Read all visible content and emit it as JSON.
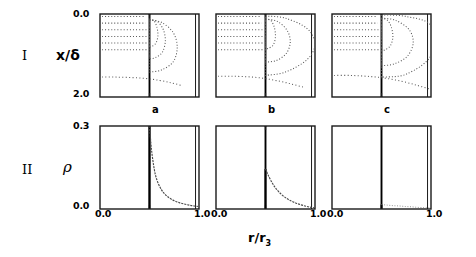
{
  "figure": {
    "rows": [
      {
        "tag": "I",
        "ylabel": "x/δ",
        "ytop": "0.0",
        "ybottom": "2.0",
        "ylim": [
          0.0,
          2.0
        ],
        "y_inverted": true,
        "plot_type": "contour"
      },
      {
        "tag": "II",
        "ylabel": "ρ",
        "ytop": "0.3",
        "ybottom": "0.0",
        "ylim": [
          0.0,
          0.3
        ],
        "y_inverted": false,
        "plot_type": "line"
      }
    ],
    "columns": [
      {
        "letter": "a",
        "xleft": "0.0",
        "xright": "1.0"
      },
      {
        "letter": "b",
        "xleft": "0.0",
        "xright": "1.0"
      },
      {
        "letter": "c",
        "xleft": "0.0",
        "xright": "1.0"
      }
    ],
    "xlabel_main": "r/r",
    "xlabel_sub": "3",
    "xlim": [
      0.0,
      1.0
    ],
    "divider_x": 0.5,
    "inner_right_x": 0.965,
    "colors": {
      "axis": "#1a1a1a",
      "divider": "#000000",
      "contour": "#555555",
      "curve": "#4a4a4a",
      "background": "#ffffff"
    }
  },
  "chart_data": [
    {
      "type": "line",
      "panel": "I-a",
      "title": "a",
      "xlabel": "r/r3",
      "ylabel": "x/δ",
      "xlim": [
        0.0,
        1.0
      ],
      "ylim": [
        0.0,
        2.0
      ],
      "y_inverted": true,
      "grid": false,
      "legend": "none",
      "description": "Dotted contour map: horizontal dotted streak contours fill the left half (r/r3 < 0.5); to the right of the bold divider at r/r3=0.5 a family of nested closed dotted loops bulges outward reaching about r/r3=0.78 near x/δ=1.0",
      "series": [
        {
          "name": "horizontal-contour-1",
          "x": [
            0.02,
            0.12,
            0.24,
            0.36,
            0.45
          ],
          "values": [
            0.06,
            0.06,
            0.06,
            0.06,
            0.06
          ]
        },
        {
          "name": "horizontal-contour-2",
          "x": [
            0.02,
            0.12,
            0.24,
            0.36,
            0.46
          ],
          "values": [
            0.22,
            0.22,
            0.22,
            0.22,
            0.22
          ]
        },
        {
          "name": "horizontal-contour-3",
          "x": [
            0.02,
            0.12,
            0.24,
            0.36,
            0.47
          ],
          "values": [
            0.38,
            0.38,
            0.38,
            0.38,
            0.38
          ]
        },
        {
          "name": "horizontal-contour-4",
          "x": [
            0.02,
            0.12,
            0.24,
            0.36,
            0.47
          ],
          "values": [
            0.54,
            0.54,
            0.54,
            0.54,
            0.54
          ]
        },
        {
          "name": "horizontal-contour-5",
          "x": [
            0.02,
            0.12,
            0.24,
            0.36,
            0.48
          ],
          "values": [
            0.7,
            0.7,
            0.7,
            0.7,
            0.7
          ]
        },
        {
          "name": "horizontal-contour-6",
          "x": [
            0.02,
            0.12,
            0.24,
            0.36,
            0.48
          ],
          "values": [
            0.86,
            0.86,
            0.86,
            0.86,
            0.86
          ]
        },
        {
          "name": "outer-loop",
          "x": [
            0.5,
            0.62,
            0.74,
            0.78,
            0.74,
            0.62,
            0.5
          ],
          "values": [
            0.15,
            0.2,
            0.45,
            0.8,
            1.15,
            1.35,
            1.4
          ]
        },
        {
          "name": "mid-loop",
          "x": [
            0.5,
            0.58,
            0.64,
            0.66,
            0.63,
            0.56,
            0.5
          ],
          "values": [
            0.14,
            0.18,
            0.38,
            0.65,
            0.92,
            1.05,
            1.08
          ]
        },
        {
          "name": "inner-loop",
          "x": [
            0.5,
            0.545,
            0.575,
            0.585,
            0.565,
            0.525,
            0.5
          ],
          "values": [
            0.12,
            0.16,
            0.32,
            0.52,
            0.7,
            0.78,
            0.8
          ]
        },
        {
          "name": "lower-sweep",
          "x": [
            0.02,
            0.15,
            0.3,
            0.45,
            0.6,
            0.72,
            0.82
          ],
          "values": [
            1.52,
            1.52,
            1.53,
            1.55,
            1.6,
            1.66,
            1.72
          ]
        }
      ]
    },
    {
      "type": "line",
      "panel": "I-b",
      "title": "b",
      "xlabel": "r/r3",
      "ylabel": "x/δ",
      "xlim": [
        0.0,
        1.0
      ],
      "ylim": [
        0.0,
        2.0
      ],
      "y_inverted": true,
      "grid": false,
      "legend": "none",
      "description": "Same dotted contour structure as panel a but the nested loops are wider, the outermost contour extending past r/r3=1.0 off the right edge of the frame",
      "series": [
        {
          "name": "horizontal-contour-1",
          "x": [
            0.02,
            0.12,
            0.24,
            0.36,
            0.45
          ],
          "values": [
            0.06,
            0.06,
            0.06,
            0.06,
            0.06
          ]
        },
        {
          "name": "horizontal-contour-2",
          "x": [
            0.02,
            0.12,
            0.24,
            0.36,
            0.46
          ],
          "values": [
            0.22,
            0.22,
            0.22,
            0.22,
            0.22
          ]
        },
        {
          "name": "horizontal-contour-3",
          "x": [
            0.02,
            0.12,
            0.24,
            0.36,
            0.47
          ],
          "values": [
            0.38,
            0.38,
            0.38,
            0.38,
            0.38
          ]
        },
        {
          "name": "horizontal-contour-4",
          "x": [
            0.02,
            0.12,
            0.24,
            0.36,
            0.47
          ],
          "values": [
            0.54,
            0.54,
            0.54,
            0.54,
            0.54
          ]
        },
        {
          "name": "horizontal-contour-5",
          "x": [
            0.02,
            0.12,
            0.24,
            0.36,
            0.48
          ],
          "values": [
            0.7,
            0.7,
            0.7,
            0.7,
            0.7
          ]
        },
        {
          "name": "horizontal-contour-6",
          "x": [
            0.02,
            0.12,
            0.24,
            0.36,
            0.48
          ],
          "values": [
            0.86,
            0.86,
            0.86,
            0.86,
            0.86
          ]
        },
        {
          "name": "outer-loop",
          "x": [
            0.5,
            0.7,
            0.92,
            1.0,
            0.92,
            0.7,
            0.5
          ],
          "values": [
            0.05,
            0.1,
            0.35,
            0.72,
            1.1,
            1.4,
            1.48
          ]
        },
        {
          "name": "mid-loop",
          "x": [
            0.5,
            0.62,
            0.72,
            0.75,
            0.71,
            0.61,
            0.5
          ],
          "values": [
            0.12,
            0.18,
            0.4,
            0.68,
            0.95,
            1.12,
            1.16
          ]
        },
        {
          "name": "inner-loop",
          "x": [
            0.5,
            0.555,
            0.59,
            0.6,
            0.58,
            0.535,
            0.5
          ],
          "values": [
            0.12,
            0.16,
            0.33,
            0.55,
            0.74,
            0.82,
            0.84
          ]
        },
        {
          "name": "lower-sweep",
          "x": [
            0.02,
            0.15,
            0.3,
            0.45,
            0.6,
            0.75,
            0.88
          ],
          "values": [
            1.5,
            1.5,
            1.51,
            1.54,
            1.6,
            1.68,
            1.76
          ]
        }
      ]
    },
    {
      "type": "line",
      "panel": "I-c",
      "title": "c",
      "xlabel": "r/r3",
      "ylabel": "x/δ",
      "xlim": [
        0.0,
        1.0
      ],
      "ylim": [
        0.0,
        2.0
      ],
      "y_inverted": true,
      "grid": false,
      "legend": "none",
      "description": "Dotted contour map with the widest loop family; the outermost contour runs clear off the right edge and a long shallow dotted arc sweeps across the lower half of the panel",
      "series": [
        {
          "name": "horizontal-contour-1",
          "x": [
            0.02,
            0.12,
            0.24,
            0.36,
            0.45
          ],
          "values": [
            0.06,
            0.06,
            0.06,
            0.06,
            0.06
          ]
        },
        {
          "name": "horizontal-contour-2",
          "x": [
            0.02,
            0.12,
            0.24,
            0.36,
            0.46
          ],
          "values": [
            0.22,
            0.22,
            0.22,
            0.22,
            0.22
          ]
        },
        {
          "name": "horizontal-contour-3",
          "x": [
            0.02,
            0.12,
            0.24,
            0.36,
            0.47
          ],
          "values": [
            0.38,
            0.38,
            0.38,
            0.38,
            0.38
          ]
        },
        {
          "name": "horizontal-contour-4",
          "x": [
            0.02,
            0.12,
            0.24,
            0.36,
            0.47
          ],
          "values": [
            0.54,
            0.54,
            0.54,
            0.54,
            0.54
          ]
        },
        {
          "name": "horizontal-contour-5",
          "x": [
            0.02,
            0.12,
            0.24,
            0.36,
            0.48
          ],
          "values": [
            0.7,
            0.7,
            0.7,
            0.7,
            0.7
          ]
        },
        {
          "name": "horizontal-contour-6",
          "x": [
            0.02,
            0.12,
            0.24,
            0.36,
            0.48
          ],
          "values": [
            0.86,
            0.86,
            0.86,
            0.86,
            0.86
          ]
        },
        {
          "name": "outer-loop",
          "x": [
            0.5,
            0.75,
            1.0,
            1.0,
            0.75,
            0.5
          ],
          "values": [
            0.02,
            0.06,
            0.28,
            1.0,
            1.45,
            1.52
          ]
        },
        {
          "name": "mid-loop",
          "x": [
            0.5,
            0.64,
            0.78,
            0.82,
            0.76,
            0.63,
            0.5
          ],
          "values": [
            0.1,
            0.15,
            0.38,
            0.7,
            1.02,
            1.2,
            1.25
          ]
        },
        {
          "name": "inner-loop",
          "x": [
            0.5,
            0.56,
            0.6,
            0.615,
            0.59,
            0.54,
            0.5
          ],
          "values": [
            0.1,
            0.15,
            0.32,
            0.56,
            0.76,
            0.86,
            0.88
          ]
        },
        {
          "name": "lower-sweep",
          "x": [
            0.02,
            0.18,
            0.35,
            0.52,
            0.7,
            0.86,
            1.0
          ],
          "values": [
            1.48,
            1.48,
            1.5,
            1.54,
            1.62,
            1.72,
            1.82
          ]
        }
      ]
    },
    {
      "type": "line",
      "panel": "II-a",
      "title": "a",
      "xlabel": "r/r3",
      "ylabel": "ρ",
      "xlim": [
        0.0,
        1.0
      ],
      "ylim": [
        0.0,
        0.3
      ],
      "grid": false,
      "legend": "none",
      "description": "Density profile ρ is zero for r/r3 < 0.5, jumps to 0.30 at the bold divider and decays steeply toward ~0.01 at r/r3=1.0",
      "x": [
        0.5,
        0.52,
        0.55,
        0.58,
        0.62,
        0.66,
        0.7,
        0.75,
        0.8,
        0.85,
        0.9,
        0.95,
        1.0
      ],
      "values": [
        0.3,
        0.215,
        0.14,
        0.1,
        0.07,
        0.052,
        0.04,
        0.03,
        0.023,
        0.018,
        0.014,
        0.011,
        0.009
      ]
    },
    {
      "type": "line",
      "panel": "II-b",
      "title": "b",
      "xlabel": "r/r3",
      "ylabel": "ρ",
      "xlim": [
        0.0,
        1.0
      ],
      "ylim": [
        0.0,
        0.3
      ],
      "grid": false,
      "legend": "none",
      "description": "Density profile ρ is zero for r/r3 < 0.5, rises to a lower peak of about 0.145 at the divider and decays more gradually, nearly reaching zero at r/r3=1.0",
      "x": [
        0.5,
        0.53,
        0.57,
        0.61,
        0.66,
        0.71,
        0.76,
        0.81,
        0.86,
        0.91,
        0.96,
        1.0
      ],
      "values": [
        0.145,
        0.12,
        0.093,
        0.072,
        0.053,
        0.039,
        0.029,
        0.021,
        0.015,
        0.01,
        0.006,
        0.004
      ]
    },
    {
      "type": "line",
      "panel": "II-c",
      "title": "c",
      "xlabel": "r/r3",
      "ylabel": "ρ",
      "xlim": [
        0.0,
        1.0
      ],
      "ylim": [
        0.0,
        0.3
      ],
      "grid": false,
      "legend": "none",
      "description": "Density profile ρ is essentially zero everywhere; only a very faint low dotted ridge of amplitude below 0.02 is visible to the right of the divider near the baseline",
      "x": [
        0.5,
        0.56,
        0.62,
        0.68,
        0.74,
        0.8,
        0.86,
        0.92,
        0.97,
        1.0
      ],
      "values": [
        0.016,
        0.014,
        0.012,
        0.011,
        0.009,
        0.008,
        0.006,
        0.005,
        0.004,
        0.003
      ]
    }
  ]
}
